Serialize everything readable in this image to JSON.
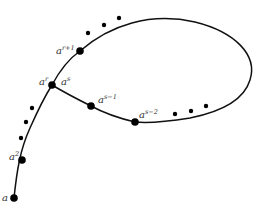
{
  "diagram": {
    "type": "orbit-path-with-cycle",
    "stroke_color": "#111111",
    "dot_color": "#000000",
    "nodes": [
      {
        "id": "a",
        "base": "a",
        "exp": "",
        "x": 14,
        "y": 198,
        "lx": 2,
        "ly": 201
      },
      {
        "id": "a2",
        "base": "a",
        "exp": "2",
        "x": 22,
        "y": 160,
        "lx": 9,
        "ly": 160
      },
      {
        "id": "ar",
        "base": "a",
        "exp": "r",
        "x": 52,
        "y": 85,
        "lx": 39,
        "ly": 85
      },
      {
        "id": "as",
        "base": "a",
        "exp": "s",
        "x": 52,
        "y": 85,
        "lx": 61,
        "ly": 85
      },
      {
        "id": "ar1",
        "base": "a",
        "exp": "r+1",
        "x": 80,
        "y": 51,
        "lx": 56,
        "ly": 54
      },
      {
        "id": "as-1",
        "base": "a",
        "exp": "s−1",
        "x": 91,
        "y": 106,
        "lx": 98,
        "ly": 103
      },
      {
        "id": "as-2",
        "base": "a",
        "exp": "s−2",
        "x": 135,
        "y": 122,
        "lx": 139,
        "ly": 118
      }
    ],
    "ellipsis_dots": [
      {
        "group": "tail",
        "points": [
          [
            21,
            138
          ],
          [
            26,
            122
          ],
          [
            32,
            108
          ]
        ]
      },
      {
        "group": "upper",
        "points": [
          [
            88,
            33
          ],
          [
            104,
            25
          ],
          [
            119,
            18
          ]
        ]
      },
      {
        "group": "lower",
        "points": [
          [
            175,
            114
          ],
          [
            191,
            111
          ],
          [
            206,
            106
          ]
        ]
      }
    ],
    "paths": {
      "tail": "M14,198 C17,170 20,150 30,128 C38,110 45,96 52,85",
      "cycle_upper": "M52,85 C60,70 70,58 80,51 C110,25 150,12 195,22 C235,32 258,55 250,80 C244,100 220,112 190,118 C165,122 145,123 135,122",
      "cycle_lower": "M135,122 C118,118 102,112 91,106 C75,98 62,91 52,85"
    }
  }
}
